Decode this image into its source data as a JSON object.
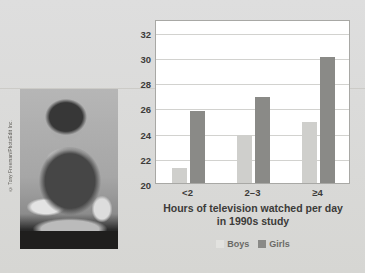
{
  "figure": {
    "photo": {
      "name": "boy-eating-junk-food-watching-tv",
      "credit": "© Tony Freeman/PhotoEdit Inc."
    },
    "legend_items": [
      {
        "label": "Boys",
        "color": "#e2e2df"
      },
      {
        "label": "Girls",
        "color": "#8a8a87"
      }
    ]
  },
  "chart_data": {
    "type": "bar",
    "title": "",
    "ylabel": "Skinfold fat measure (mm)",
    "xlabel": "Hours of television watched per day in 1990s study",
    "xlabel_line1": "Hours of television watched per day",
    "xlabel_line2": "in 1990s study",
    "categories": [
      "<2",
      "2–3",
      "≥4"
    ],
    "series": [
      {
        "name": "Boys",
        "color": "#cfcfcc",
        "values": [
          21.2,
          23.8,
          24.8
        ]
      },
      {
        "name": "Girls",
        "color": "#8a8a87",
        "values": [
          25.7,
          26.8,
          30.0
        ]
      }
    ],
    "ylim": [
      20,
      33
    ],
    "yticks": [
      20,
      22,
      24,
      26,
      28,
      30,
      32
    ],
    "ytick_labels": [
      "20",
      "22",
      "24",
      "26",
      "28",
      "30",
      "32"
    ],
    "grid": true,
    "legend_position": "bottom"
  }
}
